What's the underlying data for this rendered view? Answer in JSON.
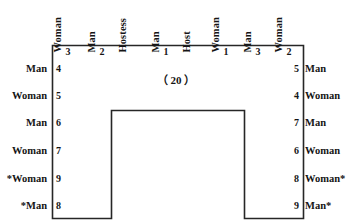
{
  "diagram": {
    "center_caption": "（ 20 ）",
    "line_color": "#262626",
    "top_seats": [
      {
        "label": "Woman",
        "number": "3"
      },
      {
        "label": "Man",
        "number": "2"
      },
      {
        "label": "Hostess",
        "number": ""
      },
      {
        "label": "Man",
        "number": "1"
      },
      {
        "label": "Host",
        "number": ""
      },
      {
        "label": "Woman",
        "number": "1"
      },
      {
        "label": "Man",
        "number": "3"
      },
      {
        "label": "Woman",
        "number": "2"
      }
    ],
    "top_numbers": [
      "3",
      "2",
      "1",
      "1",
      "3",
      "2"
    ],
    "left_seats": [
      {
        "label": "Man",
        "number": "4"
      },
      {
        "label": "Woman",
        "number": "5"
      },
      {
        "label": "Man",
        "number": "6"
      },
      {
        "label": "Woman",
        "number": "7"
      },
      {
        "label": "*Woman",
        "number": "9"
      },
      {
        "label": "*Man",
        "number": "8"
      }
    ],
    "right_seats": [
      {
        "label": "Man",
        "number": "5"
      },
      {
        "label": "Woman",
        "number": "4"
      },
      {
        "label": "Man",
        "number": "7"
      },
      {
        "label": "Woman",
        "number": "6"
      },
      {
        "label": "Woman*",
        "number": "8"
      },
      {
        "label": "Man*",
        "number": "9"
      }
    ]
  }
}
